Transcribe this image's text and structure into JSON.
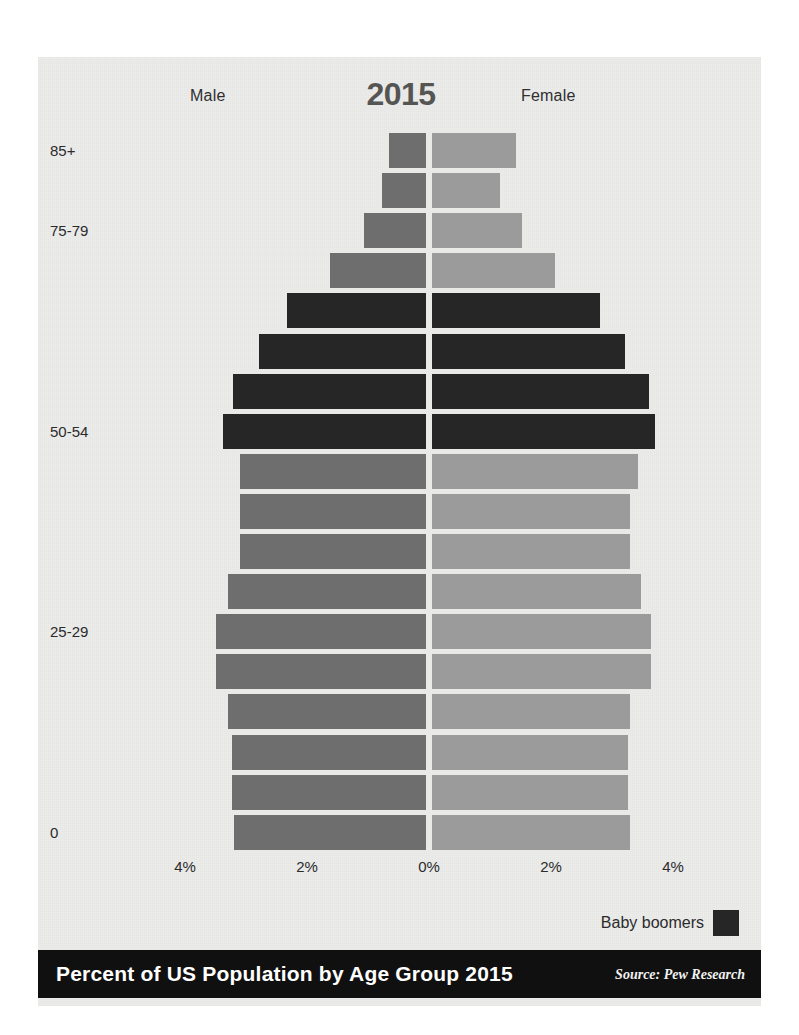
{
  "header": {
    "male_label": "Male",
    "female_label": "Female",
    "year": "2015"
  },
  "legend": {
    "label": "Baby boomers",
    "color": "#262626"
  },
  "footer": {
    "title": "Percent of US Population by Age Group 2015",
    "source": "Source: Pew Research"
  },
  "axis": {
    "ticks": [
      "4%",
      "2%",
      "0%",
      "2%",
      "4%"
    ],
    "tick_x": [
      147,
      269,
      391,
      513,
      635
    ],
    "visible_y_labels": [
      "85+",
      "75-79",
      "50-54",
      "25-29",
      "0"
    ]
  },
  "colors": {
    "background": "#ececeb",
    "male": "#6e6e6e",
    "female": "#9b9b9b",
    "baby_boomer": "#262626",
    "footer": "#101010"
  },
  "chart_data": {
    "type": "bar",
    "subtype": "population-pyramid",
    "title": "Percent of US Population by Age Group 2015",
    "subtitle": "2015",
    "xlabel": "",
    "ylabel": "",
    "xlim": [
      -4.6,
      4.6
    ],
    "xticks": [
      -4,
      -2,
      0,
      2,
      4
    ],
    "xticklabels": [
      "4%",
      "2%",
      "0%",
      "2%",
      "4%"
    ],
    "grid": false,
    "legend": [
      "Baby boomers"
    ],
    "legend_position": "bottom-right",
    "source": "Source: Pew Research",
    "units": "percent of total US population",
    "categories": [
      "85+",
      "80-84",
      "75-79",
      "70-74",
      "65-69",
      "60-64",
      "55-59",
      "50-54",
      "45-49",
      "40-44",
      "35-39",
      "30-34",
      "25-29",
      "20-24",
      "15-19",
      "10-14",
      "5-9",
      "0-4"
    ],
    "labelled_categories": [
      "85+",
      "75-79",
      "50-54",
      "25-29",
      "0"
    ],
    "baby_boomer_categories": [
      "65-69",
      "60-64",
      "55-59",
      "50-54"
    ],
    "series": [
      {
        "name": "Male",
        "side": "left",
        "values": [
          0.6,
          0.72,
          1.02,
          1.57,
          2.28,
          2.74,
          3.16,
          3.32,
          3.05,
          3.05,
          3.05,
          3.24,
          3.44,
          3.44,
          3.24,
          3.18,
          3.18,
          3.15
        ]
      },
      {
        "name": "Female",
        "side": "right",
        "values": [
          1.38,
          1.11,
          1.48,
          2.01,
          2.76,
          3.17,
          3.56,
          3.65,
          3.38,
          3.24,
          3.24,
          3.42,
          3.59,
          3.59,
          3.24,
          3.21,
          3.21,
          3.24
        ]
      }
    ]
  }
}
